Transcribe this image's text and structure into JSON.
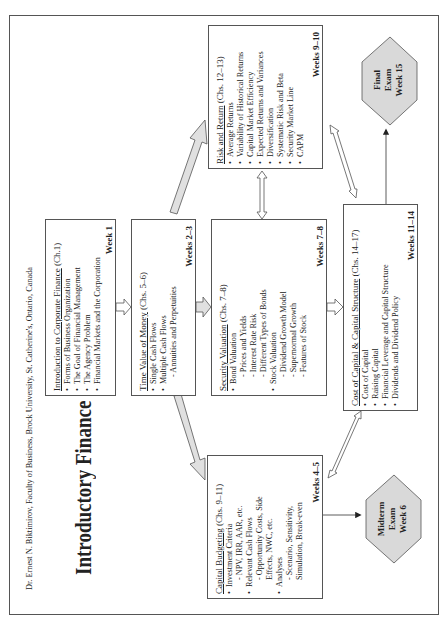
{
  "author": "Dr. Ernest N. Biktimirov, Faculty of Business, Brock University, St. Catherine's, Ontario, Canada",
  "title": "Introductory Finance 101",
  "colors": {
    "border": "#555555",
    "hexagon_fill": "#d9d9d9",
    "big_arrow_fill": "#e0e0e0"
  },
  "boxes": {
    "intro": {
      "heading": "Introduction to Corporate Finance",
      "chapters": " (Ch.1)",
      "items": [
        "Forms of Business Organization",
        "The Goal of Financial Management",
        "The Agency Problem",
        "Financial Markets and the Corporation"
      ],
      "weeks": "Week 1"
    },
    "tvm": {
      "heading": "Time Value of Money",
      "chapters": " (Chs. 5–6)",
      "items": [
        "Single Cash Flows",
        "Multiple Cash Flows"
      ],
      "subitems": [
        "- Annuities and Perpetuities"
      ],
      "weeks": "Weeks 2–3"
    },
    "security": {
      "heading": "Security Valuation",
      "chapters": " (Chs. 7–8)",
      "item1": "Bond Valuation",
      "item1_sub": [
        "- Prices and Yields",
        "- Interest Rate Risk",
        "- Different Types of Bonds"
      ],
      "item2": "Stock Valuation",
      "item2_sub": [
        "- Dividend Growth Model",
        "- Supernormal Growth",
        "- Features of Stock"
      ],
      "weeks": "Weeks 7–8"
    },
    "cost": {
      "heading": "Cost of Capital & Capital Structure",
      "chapters": " (Chs. 14–17)",
      "items": [
        "Cost of Capital",
        "Raising Capital",
        "Financial Leverage and Capital Structure",
        "Dividends and Dividend Policy"
      ],
      "weeks": "Weeks 11–14"
    },
    "risk": {
      "heading": "Risk and Return",
      "chapters": " (Chs. 12–13)",
      "items": [
        "Average Returns",
        "Variability of Historical Returns",
        "Capital Market Efficiency",
        "Expected Returns and Variances",
        "Diversification",
        "Systematic Risk and Beta",
        "Security Market Line",
        "CAPM"
      ],
      "weeks": "Weeks 9–10"
    },
    "capbud": {
      "heading": "Capital Budgeting",
      "chapters": " (Chs. 9–11)",
      "item1": "Investment Criteria",
      "item1_sub": [
        "- NPV, IRR, AAR, etc."
      ],
      "item2": "Relevant Cash Flows",
      "item2_sub": [
        "- Opportunity Costs, Side",
        "Effects, NWC, etc."
      ],
      "item3": "Analyses",
      "item3_sub": [
        "- Scenario, Sensitivity,",
        "Simulation, Break-even"
      ],
      "weeks": "Weeks 4–5"
    }
  },
  "exams": {
    "midterm": [
      "Midterm",
      "Exam",
      "Week 6"
    ],
    "final": [
      "Final",
      "Exam",
      "Week 15"
    ]
  }
}
